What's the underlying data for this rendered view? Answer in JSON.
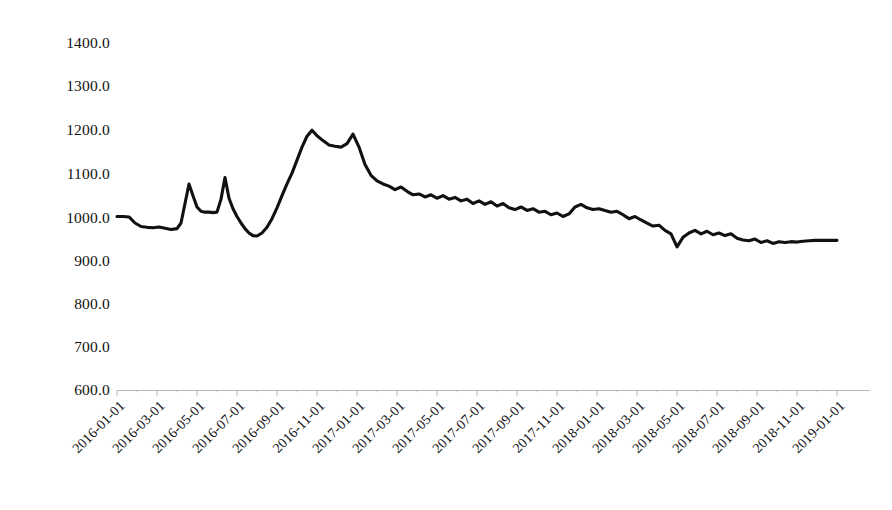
{
  "chart_data": {
    "type": "line",
    "title": "",
    "subtitle": "",
    "xlabel": "",
    "ylabel": "",
    "grid": false,
    "legend": false,
    "legend_position": "none",
    "line_color": "#111111",
    "background_color": "#ffffff",
    "xlim": [
      "2016-01-01",
      "2019-01-01"
    ],
    "ylim": [
      600.0,
      1400.0
    ],
    "ytick_labels": [
      "1400.0",
      "1300.0",
      "1200.0",
      "1100.0",
      "1000.0",
      "900.0",
      "800.0",
      "700.0",
      "600.0"
    ],
    "ytick_values": [
      1400,
      1300,
      1200,
      1100,
      1000,
      900,
      800,
      700,
      600
    ],
    "xtick_labels": [
      "2016-01-01",
      "2016-03-01",
      "2016-05-01",
      "2016-07-01",
      "2016-09-01",
      "2016-11-01",
      "2017-01-01",
      "2017-03-01",
      "2017-05-01",
      "2017-07-01",
      "2017-09-01",
      "2017-11-01",
      "2018-01-01",
      "2018-03-01",
      "2018-05-01",
      "2018-07-01",
      "2018-09-01",
      "2018-11-01",
      "2019-01-01"
    ],
    "series": [
      {
        "name": "index",
        "x": [
          0.0,
          0.3,
          0.6,
          0.9,
          1.2,
          1.5,
          1.8,
          2.1,
          2.4,
          2.7,
          3.0,
          3.2,
          3.4,
          3.6,
          3.8,
          4.0,
          4.2,
          4.4,
          4.6,
          4.8,
          5.0,
          5.2,
          5.4,
          5.6,
          5.8,
          6.0,
          6.2,
          6.4,
          6.6,
          6.8,
          7.0,
          7.25,
          7.5,
          7.75,
          8.0,
          8.25,
          8.5,
          8.75,
          9.0,
          9.25,
          9.5,
          9.75,
          10.0,
          10.3,
          10.6,
          10.9,
          11.2,
          11.5,
          11.8,
          12.1,
          12.4,
          12.7,
          13.0,
          13.3,
          13.6,
          13.9,
          14.2,
          14.5,
          14.8,
          15.1,
          15.4,
          15.7,
          16.0,
          16.3,
          16.6,
          16.9,
          17.2,
          17.5,
          17.8,
          18.1,
          18.4,
          18.7,
          19.0,
          19.3,
          19.6,
          19.9,
          20.2,
          20.5,
          20.8,
          21.1,
          21.4,
          21.7,
          22.0,
          22.3,
          22.6,
          22.9,
          23.2,
          23.5,
          23.8,
          24.1,
          24.4,
          24.7,
          25.0,
          25.3,
          25.6,
          25.9,
          26.2,
          26.5,
          26.8,
          27.1,
          27.4,
          27.7,
          28.0,
          28.3,
          28.6,
          28.9,
          29.2,
          29.5,
          29.8,
          30.1,
          30.4,
          30.7,
          31.0,
          31.3,
          31.6,
          31.9,
          32.2,
          32.5,
          32.8,
          33.1,
          33.4,
          33.7,
          34.0,
          34.3,
          34.6,
          34.9,
          35.2,
          35.5,
          35.8,
          36.0
        ],
        "values": [
          1000,
          1000,
          999,
          985,
          977,
          975,
          974,
          976,
          973,
          970,
          972,
          985,
          1030,
          1075,
          1048,
          1022,
          1012,
          1010,
          1010,
          1009,
          1010,
          1040,
          1090,
          1042,
          1018,
          1000,
          985,
          972,
          962,
          956,
          955,
          962,
          975,
          995,
          1020,
          1048,
          1075,
          1100,
          1130,
          1160,
          1185,
          1199,
          1186,
          1175,
          1165,
          1162,
          1160,
          1168,
          1190,
          1160,
          1120,
          1095,
          1082,
          1075,
          1070,
          1062,
          1068,
          1058,
          1050,
          1052,
          1045,
          1050,
          1042,
          1048,
          1040,
          1044,
          1036,
          1040,
          1030,
          1036,
          1028,
          1034,
          1024,
          1030,
          1020,
          1016,
          1022,
          1014,
          1018,
          1010,
          1012,
          1004,
          1008,
          1000,
          1006,
          1022,
          1028,
          1020,
          1016,
          1018,
          1014,
          1010,
          1012,
          1004,
          995,
          1000,
          992,
          985,
          978,
          980,
          968,
          960,
          930,
          952,
          962,
          968,
          960,
          966,
          958,
          962,
          956,
          960,
          950,
          946,
          944,
          948,
          940,
          944,
          938,
          942,
          940,
          942,
          941,
          943,
          944,
          945,
          945,
          945,
          945,
          945
        ]
      }
    ]
  },
  "axes": {
    "y_axis_name": "value-axis",
    "x_axis_name": "date-axis"
  }
}
